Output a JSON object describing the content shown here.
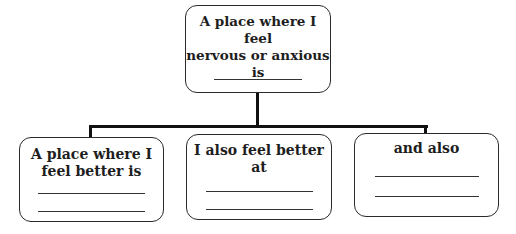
{
  "diagram": {
    "type": "tree",
    "root": {
      "label": "A place where I feel nervous or anxious is",
      "line1": "A place where I feel",
      "line2": "nervous or anxious",
      "line3": "is",
      "blanks": 1
    },
    "children": [
      {
        "label": "A place where I feel better is",
        "line1": "A place where I",
        "line2": "feel better is",
        "blanks": 2
      },
      {
        "label": "I also feel better at",
        "line1": "I also feel better",
        "line2": "at",
        "blanks": 2
      },
      {
        "label": "and also",
        "line1": "and also",
        "blanks": 2
      }
    ],
    "colors": {
      "border": "#2a2a2a",
      "connector": "#111111",
      "text": "#1e1e1e",
      "background": "#ffffff"
    }
  }
}
